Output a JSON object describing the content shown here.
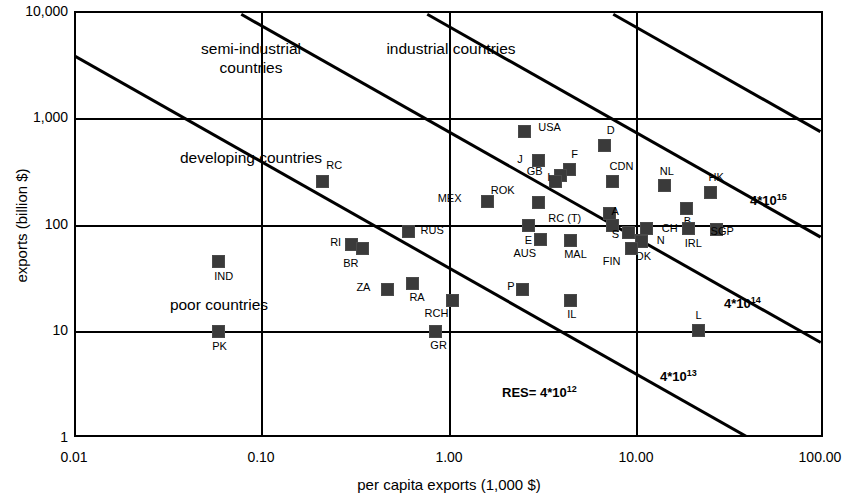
{
  "chart_data": {
    "type": "scatter",
    "title": "",
    "xlabel": "per capita exports (1,000 $)",
    "ylabel": "exports (billion $)",
    "xscale": "log",
    "yscale": "log",
    "xlim": [
      0.01,
      100
    ],
    "ylim": [
      1,
      10000
    ],
    "xticks": [
      "0.01",
      "0.10",
      "1.00",
      "10.00",
      "100.00"
    ],
    "xtick_values": [
      0.01,
      0.1,
      1,
      10,
      100
    ],
    "yticks": [
      "10,000",
      "1,000",
      "100",
      "10",
      "1"
    ],
    "ytick_values": [
      10000,
      1000,
      100,
      10,
      1
    ],
    "grid": true,
    "legend": "none",
    "marker": "filled-square",
    "marker_color": "#3a3a3a",
    "points": [
      {
        "label": "USA",
        "x": 2.55,
        "y": 760,
        "lx": 14,
        "ly": -4
      },
      {
        "label": "D",
        "x": 6.9,
        "y": 560,
        "lx": 2,
        "ly": -15
      },
      {
        "label": "J",
        "x": 3.05,
        "y": 400,
        "lx": -22,
        "ly": -1
      },
      {
        "label": "F",
        "x": 4.45,
        "y": 330,
        "lx": 2,
        "ly": -15
      },
      {
        "label": "GB",
        "x": 4.0,
        "y": 290,
        "lx": -24,
        "ly": -4
      },
      {
        "label": "CDN",
        "x": 7.6,
        "y": 255,
        "lx": -3,
        "ly": -15
      },
      {
        "label": "I",
        "x": 3.75,
        "y": 255,
        "lx": -11,
        "ly": -4
      },
      {
        "label": "NL",
        "x": 14.5,
        "y": 230,
        "lx": -5,
        "ly": -15
      },
      {
        "label": "HK",
        "x": 25.5,
        "y": 200,
        "lx": -2,
        "ly": -15
      },
      {
        "label": "MEX",
        "x": 1.62,
        "y": 165,
        "lx": -32,
        "ly": -3
      },
      {
        "label": "ROK",
        "x": 3.05,
        "y": 160,
        "lx": -30,
        "ly": -12
      },
      {
        "label": "B",
        "x": 19.0,
        "y": 140,
        "lx": -3,
        "ly": 12
      },
      {
        "label": "RC (T)",
        "x": 7.3,
        "y": 125,
        "lx": -34,
        "ly": 4
      },
      {
        "label": "A",
        "x": 7.6,
        "y": 96,
        "lx": -1,
        "ly": -15
      },
      {
        "label": "RC",
        "x": 0.21,
        "y": 255,
        "lx": 4,
        "ly": -16
      },
      {
        "label": "E",
        "x": 2.7,
        "y": 96,
        "lx": -4,
        "ly": 14
      },
      {
        "label": "S",
        "x": 9.2,
        "y": 83,
        "lx": -15,
        "ly": 1
      },
      {
        "label": "CH",
        "x": 11.6,
        "y": 90,
        "lx": 15,
        "ly": -1
      },
      {
        "label": "IRL",
        "x": 19.5,
        "y": 90,
        "lx": -4,
        "ly": 14
      },
      {
        "label": "SGP",
        "x": 27.5,
        "y": 88,
        "lx": -6,
        "ly": 1
      },
      {
        "label": "N",
        "x": 10.9,
        "y": 70,
        "lx": 15,
        "ly": 0
      },
      {
        "label": "DK",
        "x": 10.9,
        "y": 68,
        "lx": -6,
        "ly": 14
      },
      {
        "label": "MAL",
        "x": 4.5,
        "y": 70,
        "lx": -6,
        "ly": 14
      },
      {
        "label": "AUS",
        "x": 3.1,
        "y": 72,
        "lx": -10,
        "ly": 14
      },
      {
        "label": "FIN",
        "x": 9.6,
        "y": 58,
        "lx": -17,
        "ly": 12
      },
      {
        "label": "RUS",
        "x": 0.61,
        "y": 85,
        "lx": 12,
        "ly": -1
      },
      {
        "label": "RI",
        "x": 0.3,
        "y": 64,
        "lx": -16,
        "ly": -2
      },
      {
        "label": "BR",
        "x": 0.345,
        "y": 58,
        "lx": -10,
        "ly": 14
      },
      {
        "label": "IND",
        "x": 0.058,
        "y": 44,
        "lx": -4,
        "ly": 14
      },
      {
        "label": "RA",
        "x": 0.64,
        "y": 27,
        "lx": -3,
        "ly": 13
      },
      {
        "label": "ZA",
        "x": 0.47,
        "y": 24,
        "lx": -23,
        "ly": -2
      },
      {
        "label": "P",
        "x": 2.5,
        "y": 24,
        "lx": -14,
        "ly": -3
      },
      {
        "label": "IL",
        "x": 4.5,
        "y": 19,
        "lx": -3,
        "ly": 14
      },
      {
        "label": "RCH",
        "x": 1.05,
        "y": 19,
        "lx": -10,
        "ly": 13
      },
      {
        "label": "GR",
        "x": 0.85,
        "y": 9.5,
        "lx": -5,
        "ly": 13
      },
      {
        "label": "PK",
        "x": 0.058,
        "y": 9.5,
        "lx": -6,
        "ly": 14
      },
      {
        "label": "L",
        "x": 22.0,
        "y": 9.8,
        "lx": -3,
        "ly": -15
      }
    ],
    "zones": [
      {
        "text": "semi-industrial",
        "x": 175,
        "y": 47
      },
      {
        "text": "countries",
        "x": 175,
        "y": 66
      },
      {
        "text": "industrial countries",
        "x": 375,
        "y": 47
      },
      {
        "text": "developing countries",
        "x": 175,
        "y": 156
      },
      {
        "text": "poor countries",
        "x": 143,
        "y": 303
      }
    ],
    "iso_lines": [
      {
        "label_base": "RES= 4*10",
        "label_exp": "12",
        "lx": 500,
        "ly": 382
      },
      {
        "label_base": "4*10",
        "label_exp": "13",
        "lx": 658,
        "ly": 366
      },
      {
        "label_base": "4*10",
        "label_exp": "14",
        "lx": 722,
        "ly": 293
      },
      {
        "label_base": "4*10",
        "label_exp": "15",
        "lx": 748,
        "ly": 190
      }
    ],
    "annotations": {
      "note": "Iso-lines of constant total resource use; slope -1 on log-log axes (y * x = const)."
    }
  },
  "axes": {
    "x_title": "per capita exports (1,000 $)",
    "y_title": "exports (billion $)",
    "x_ticks": [
      "0.01",
      "0.10",
      "1.00",
      "10.00",
      "100.00"
    ],
    "y_ticks": [
      "10,000",
      "1,000",
      "100",
      "10",
      "1"
    ]
  }
}
